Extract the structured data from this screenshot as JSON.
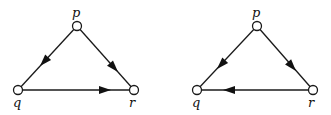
{
  "diagrams": [
    {
      "id": "left",
      "nodes": [
        {
          "id": "p",
          "label": "p",
          "x": 77,
          "y": 26
        },
        {
          "id": "q",
          "label": "q",
          "x": 18,
          "y": 90
        },
        {
          "id": "r",
          "label": "r",
          "x": 134,
          "y": 90
        }
      ],
      "edges": [
        {
          "from": "p",
          "to": "q"
        },
        {
          "from": "p",
          "to": "r"
        },
        {
          "from": "q",
          "to": "r"
        }
      ]
    },
    {
      "id": "right",
      "nodes": [
        {
          "id": "p",
          "label": "p",
          "x": 257,
          "y": 26
        },
        {
          "id": "q",
          "label": "q",
          "x": 197,
          "y": 90
        },
        {
          "id": "r",
          "label": "r",
          "x": 313,
          "y": 90
        }
      ],
      "edges": [
        {
          "from": "p",
          "to": "q"
        },
        {
          "from": "p",
          "to": "r"
        },
        {
          "from": "r",
          "to": "q"
        }
      ]
    }
  ],
  "labels": {
    "left_p": "p",
    "left_q": "q",
    "left_r": "r",
    "right_p": "p",
    "right_q": "q",
    "right_r": "r"
  }
}
